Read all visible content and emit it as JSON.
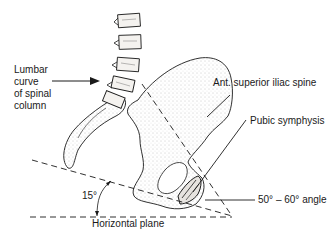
{
  "diagram": {
    "labels": {
      "lumbar_curve": "Lumbar curve of spinal column",
      "lumbar_line1": "Lumbar",
      "lumbar_line2": "curve",
      "lumbar_line3": "of spinal",
      "lumbar_line4": "column",
      "asis": "Ant. superior iliac spine",
      "pubic_symphysis": "Pubic symphysis",
      "angle_50_60": "50° – 60°  angle",
      "angle_15": "15°",
      "horizontal_plane": "Horizontal plane"
    },
    "colors": {
      "ink": "#1a1a1a",
      "bone_fill": "#f3f1ee",
      "stipple": "#9a9a9a",
      "background": "#ffffff"
    }
  }
}
